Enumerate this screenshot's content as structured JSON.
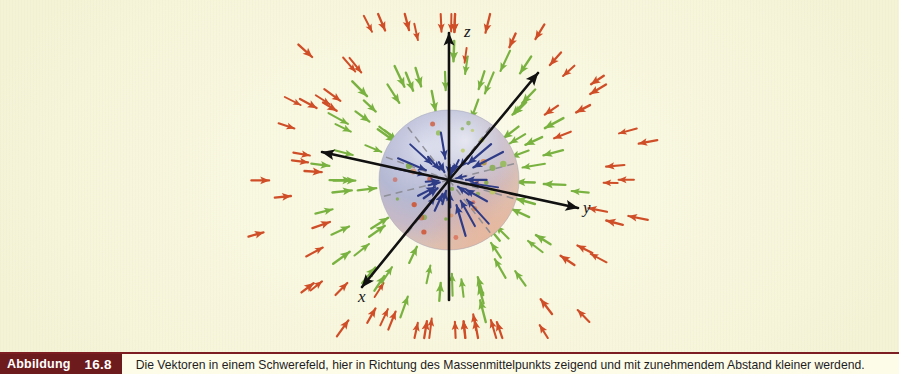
{
  "figure": {
    "background_color": "#f7f5dc",
    "axes": [
      {
        "name": "z",
        "label": "z",
        "direction": "up"
      },
      {
        "name": "y",
        "label": "y",
        "direction": "right"
      },
      {
        "name": "x",
        "label": "x",
        "direction": "lower-left"
      }
    ],
    "sphere": {
      "center_x": 449,
      "center_y": 180,
      "radius": 70,
      "gradient_from": "#b9bcd6",
      "gradient_to": "#e8c6b4"
    },
    "colors": {
      "inner_arrow": "#2e3b86",
      "mid_arrow": "#76b13f",
      "outer_arrow": "#d2502a",
      "axis_line": "#111111",
      "dashed_line": "#8d8d94",
      "caption_bar": "#6e1b1e"
    }
  },
  "caption": {
    "tag_word": "Abbildung",
    "tag_number": "16.8",
    "text": "Die Vektoren in einem Schwerefeld, hier in Richtung des Massenmittelpunkts zeigend und mit zunehmendem Abstand kleiner werdend."
  },
  "chart_data": {
    "type": "scatter",
    "title": "Die Vektoren in einem Schwerefeld",
    "xlabel": "x",
    "ylabel": "y",
    "zlabel": "z",
    "legend": [],
    "grid": false,
    "series": [
      {
        "name": "innere Vektoren (im Kugelinneren)",
        "color": "#2e3b86",
        "count": 26,
        "radius_band": [
          14,
          62
        ],
        "direction": "inward",
        "note": "Betrag waechst linear mit r im Inneren"
      },
      {
        "name": "mittlere Vektoren",
        "color": "#76b13f",
        "count": 44,
        "radius_band": [
          78,
          150
        ],
        "direction": "inward",
        "note": "Betrag faellt mit 1/r^2 ausserhalb"
      },
      {
        "name": "aeussere Vektoren",
        "color": "#d2502a",
        "count": 40,
        "radius_band": [
          150,
          215
        ],
        "direction": "inward",
        "note": "kleinste Betraege, groesster Abstand"
      }
    ],
    "annotations": [
      {
        "label": "z",
        "x": 470,
        "y": 30
      },
      {
        "label": "y",
        "x": 590,
        "y": 208
      },
      {
        "label": "x",
        "x": 365,
        "y": 295
      }
    ]
  }
}
